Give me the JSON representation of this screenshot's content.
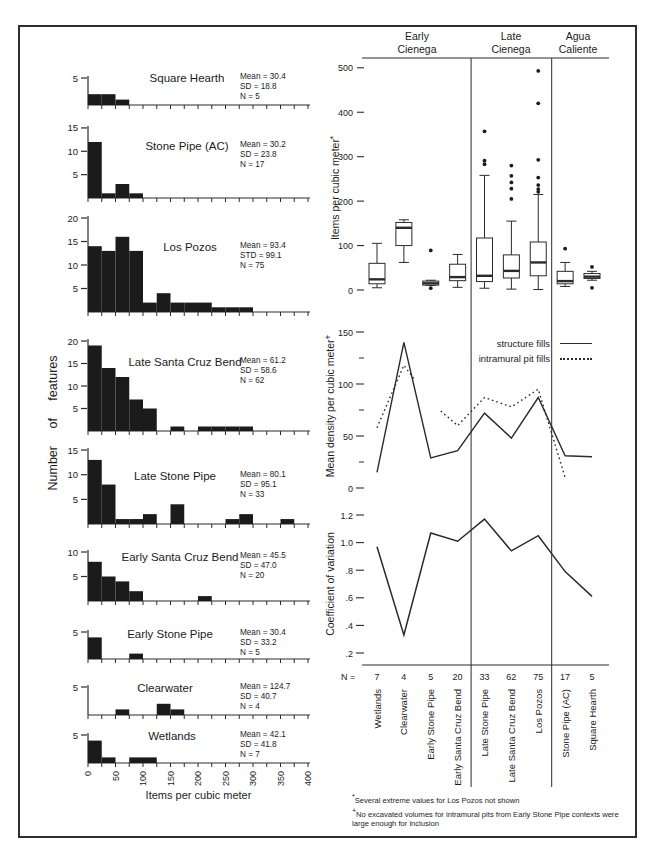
{
  "figure": {
    "groups": [
      {
        "line1": "Early",
        "line2": "Cienega"
      },
      {
        "line1": "Late",
        "line2": "Cienega"
      },
      {
        "line1": "Agua",
        "line2": "Caliente"
      }
    ],
    "n_label": "N =",
    "footnotes": [
      {
        "marker": "*",
        "text": "Several extreme values for Los Pozos not shown"
      },
      {
        "marker": "+",
        "text": "No excavated volumes for intramural pits from Early Stone Pipe contexts were large enough for inclusion"
      }
    ]
  },
  "chart_data": [
    {
      "type": "bar",
      "id": "feature-density-histograms",
      "xlabel": "Items per cubic meter",
      "ylabel": "Number of features",
      "bin_width": 25,
      "x_ticks": [
        0,
        50,
        100,
        150,
        200,
        250,
        300,
        350,
        400
      ],
      "panels": [
        {
          "title": "Square Hearth",
          "stats": [
            "Mean = 30.4",
            "SD = 18.8",
            "N = 5"
          ],
          "yticks": [
            5
          ],
          "bins": [
            2,
            2,
            1
          ]
        },
        {
          "title": "Stone Pipe (AC)",
          "stats": [
            "Mean = 30.2",
            "SD = 23.8",
            "N = 17"
          ],
          "yticks": [
            5,
            10,
            15
          ],
          "bins": [
            12,
            1,
            3,
            1
          ]
        },
        {
          "title": "Los Pozos",
          "stats": [
            "Mean = 93.4",
            "STD = 99.1",
            "N = 75"
          ],
          "yticks": [
            5,
            10,
            15,
            20
          ],
          "bins": [
            14,
            13,
            16,
            13,
            2,
            4,
            2,
            2,
            2,
            1,
            1,
            1
          ]
        },
        {
          "title": "Late Santa Cruz Bend",
          "stats": [
            "Mean = 61.2",
            "SD = 58.6",
            "N = 62"
          ],
          "yticks": [
            5,
            10,
            15,
            20
          ],
          "bins": [
            19,
            14,
            12,
            7,
            5,
            0,
            1,
            0,
            1,
            1,
            1,
            1
          ]
        },
        {
          "title": "Late Stone Pipe",
          "stats": [
            "Mean = 80.1",
            "SD = 95.1",
            "N = 33"
          ],
          "yticks": [
            5,
            10,
            15
          ],
          "bins": [
            13,
            8,
            1,
            1,
            2,
            0,
            4,
            0,
            0,
            0,
            1,
            2,
            0,
            0,
            1
          ]
        },
        {
          "title": "Early Santa Cruz Bend",
          "stats": [
            "Mean = 45.5",
            "SD = 47.0",
            "N = 20"
          ],
          "yticks": [
            5,
            10
          ],
          "bins": [
            8,
            5,
            4,
            2,
            0,
            0,
            0,
            0,
            1
          ]
        },
        {
          "title": "Early Stone Pipe",
          "stats": [
            "Mean = 30.4",
            "SD = 33.2",
            "N = 5"
          ],
          "yticks": [
            5
          ],
          "bins": [
            4,
            0,
            0,
            1
          ]
        },
        {
          "title": "Clearwater",
          "stats": [
            "Mean = 124.7",
            "SD = 40.7",
            "N = 4"
          ],
          "yticks": [
            5
          ],
          "bins": [
            0,
            0,
            1,
            0,
            0,
            2,
            1
          ]
        },
        {
          "title": "Wetlands",
          "stats": [
            "Mean = 42.1",
            "SD = 41.8",
            "N = 7"
          ],
          "yticks": [
            5
          ],
          "bins": [
            4,
            1,
            0,
            1,
            1
          ]
        }
      ]
    },
    {
      "type": "box",
      "id": "items-per-cubic-meter-boxplot",
      "ylabel": "Items per cubic meter",
      "ylabel_sup": "*",
      "yticks": [
        0,
        100,
        200,
        300,
        400,
        500
      ],
      "categories": [
        "Wetlands",
        "Clearwater",
        "Early Stone Pipe",
        "Early Santa Cruz Bend",
        "Late Stone Pipe",
        "Late Santa Cruz Bend",
        "Los Pozos",
        "Stone Pipe (AC)",
        "Square Hearth"
      ],
      "boxes": [
        {
          "lo": 5,
          "q1": 14,
          "med": 24,
          "q3": 60,
          "hi": 105,
          "outliers": []
        },
        {
          "lo": 62,
          "q1": 100,
          "med": 140,
          "q3": 152,
          "hi": 158,
          "outliers": []
        },
        {
          "lo": 10,
          "q1": 11,
          "med": 15,
          "q3": 20,
          "hi": 22,
          "outliers": [
            89,
            4
          ]
        },
        {
          "lo": 6,
          "q1": 21,
          "med": 29,
          "q3": 58,
          "hi": 80,
          "outliers": []
        },
        {
          "lo": 4,
          "q1": 19,
          "med": 32,
          "q3": 117,
          "hi": 258,
          "outliers": [
            283,
            291,
            357
          ]
        },
        {
          "lo": 2,
          "q1": 27,
          "med": 43,
          "q3": 79,
          "hi": 155,
          "outliers": [
            205,
            228,
            242,
            257,
            280
          ]
        },
        {
          "lo": 1,
          "q1": 32,
          "med": 62,
          "q3": 108,
          "hi": 215,
          "outliers": [
            221,
            227,
            236,
            253,
            293,
            420,
            493
          ]
        },
        {
          "lo": 8,
          "q1": 14,
          "med": 20,
          "q3": 42,
          "hi": 62,
          "outliers": [
            93
          ]
        },
        {
          "lo": 22,
          "q1": 26,
          "med": 30,
          "q3": 37,
          "hi": 42,
          "outliers": [
            52,
            5
          ]
        }
      ]
    },
    {
      "type": "line",
      "id": "mean-density",
      "ylabel": "Mean density per cubic meter",
      "ylabel_sup": "+",
      "yticks": [
        0,
        50,
        100,
        150
      ],
      "legend": [
        "structure fills",
        "intramural pit fills"
      ],
      "categories": [
        "Wetlands",
        "Clearwater",
        "Early Stone Pipe",
        "Early Santa Cruz Bend",
        "Late Stone Pipe",
        "Late Santa Cruz Bend",
        "Los Pozos",
        "Stone Pipe (AC)",
        "Square Hearth"
      ],
      "structure_fills": [
        15,
        140,
        29,
        36,
        72,
        48,
        87,
        31,
        30
      ],
      "intramural_pit_fills": [
        58,
        118,
        null,
        60,
        87,
        78,
        95,
        10,
        null
      ]
    },
    {
      "type": "line",
      "id": "coefficient-of-variation",
      "ylabel": "Coefficient of variation",
      "ytick_labels": [
        ".2",
        ".4",
        ".6",
        ".8",
        "1.0",
        "1.2"
      ],
      "yticks": [
        0.2,
        0.4,
        0.6,
        0.8,
        1.0,
        1.2
      ],
      "categories": [
        "Wetlands",
        "Clearwater",
        "Early Stone Pipe",
        "Early Santa Cruz Bend",
        "Late Stone Pipe",
        "Late Santa Cruz Bend",
        "Los Pozos",
        "Stone Pipe (AC)",
        "Square Hearth"
      ],
      "values": [
        0.97,
        0.33,
        1.07,
        1.01,
        1.17,
        0.94,
        1.05,
        0.79,
        0.61
      ],
      "n_values": [
        7,
        4,
        5,
        20,
        33,
        62,
        75,
        17,
        5
      ]
    }
  ]
}
